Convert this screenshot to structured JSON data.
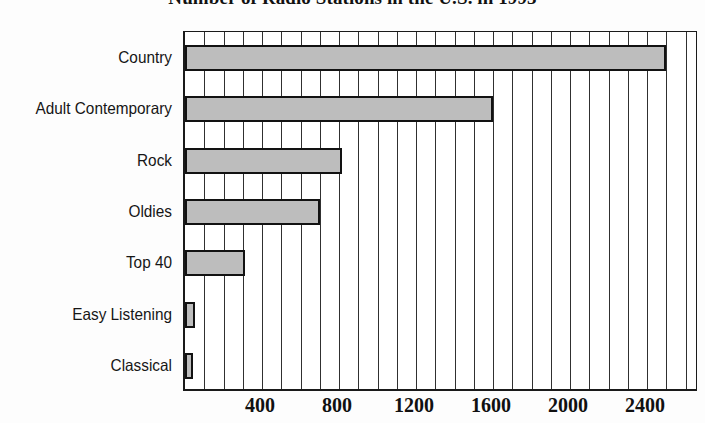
{
  "chart_data": {
    "type": "bar",
    "orientation": "horizontal",
    "title": "Number of Radio Stations in the U.S. in 1993",
    "xlabel": "",
    "ylabel": "",
    "categories": [
      "Country",
      "Adult Contemporary",
      "Rock",
      "Oldies",
      "Top 40",
      "Easy Listening",
      "Classical"
    ],
    "values": [
      2500,
      1600,
      815,
      700,
      310,
      50,
      40
    ],
    "xticks": [
      400,
      800,
      1200,
      1600,
      2000,
      2400
    ],
    "xtick_labels": [
      "400",
      "800",
      "1200",
      "1600",
      "2000",
      "2400"
    ],
    "xlim": [
      0,
      2670
    ],
    "grid": "vertical-major-every-100",
    "legend": "none",
    "bar_fill_color": "#bdbdbd",
    "bar_edge_color": "#121212",
    "axis_color": "#1a1a1a",
    "background_color": "#ffffff"
  },
  "axis": {
    "tick_major_step": 400,
    "gridline_step": 100
  }
}
